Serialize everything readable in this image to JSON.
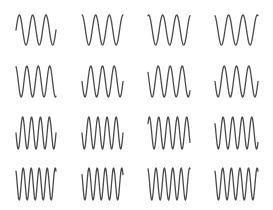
{
  "grid": {
    "rows": 4,
    "cols": 4,
    "stroke_color": "#4a4a4a",
    "stroke_width": 1.3,
    "background": "#ffffff"
  },
  "columns_x": [
    {
      "x0": 16,
      "x1": 56
    },
    {
      "x0": 82,
      "x1": 123
    },
    {
      "x0": 148,
      "x1": 190
    },
    {
      "x0": 215,
      "x1": 258
    }
  ],
  "rows_y": [
    {
      "top": 15,
      "bottom": 45,
      "cycles": 3.0
    },
    {
      "top": 66,
      "bottom": 97,
      "cycles": 3.5
    },
    {
      "top": 117,
      "bottom": 149,
      "cycles": 4.5
    },
    {
      "top": 168,
      "bottom": 200,
      "cycles": 5.0
    }
  ],
  "cells": [
    {
      "row": 0,
      "col": 0,
      "phase": 0.0
    },
    {
      "row": 0,
      "col": 1,
      "phase": 0.25
    },
    {
      "row": 0,
      "col": 2,
      "phase": 0.2
    },
    {
      "row": 0,
      "col": 3,
      "phase": 0.3
    },
    {
      "row": 1,
      "col": 0,
      "phase": 0.3
    },
    {
      "row": 1,
      "col": 1,
      "phase": 0.5
    },
    {
      "row": 1,
      "col": 2,
      "phase": 0.4
    },
    {
      "row": 1,
      "col": 3,
      "phase": 0.5
    },
    {
      "row": 2,
      "col": 0,
      "phase": 0.5
    },
    {
      "row": 2,
      "col": 1,
      "phase": 0.5
    },
    {
      "row": 2,
      "col": 2,
      "phase": 0.1
    },
    {
      "row": 2,
      "col": 3,
      "phase": 0.4
    },
    {
      "row": 3,
      "col": 0,
      "phase": 0.35
    },
    {
      "row": 3,
      "col": 1,
      "phase": 0.4
    },
    {
      "row": 3,
      "col": 2,
      "phase": 0.3
    },
    {
      "row": 3,
      "col": 3,
      "phase": 0.35
    }
  ]
}
